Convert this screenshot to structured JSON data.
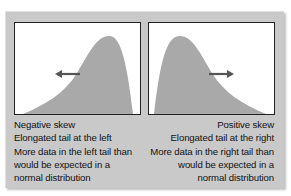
{
  "colors": {
    "frame": "#c9c9c9",
    "curve_fill": "#a9a9a9",
    "arrow": "#555555",
    "panel_bg": "#ffffff"
  },
  "left_panel": {
    "title": "Negative skew",
    "arrow_direction": "left",
    "lines": [
      "Negative skew",
      "Elongated tail at the left",
      "More data in the left tail than",
      "would be expected in a",
      "normal distribution"
    ]
  },
  "right_panel": {
    "title": "Positive skew",
    "arrow_direction": "right",
    "lines": [
      "Positive skew",
      "Elongated tail at the right",
      "More data in the right tail than",
      "would be expected in a",
      "normal distribution"
    ]
  }
}
